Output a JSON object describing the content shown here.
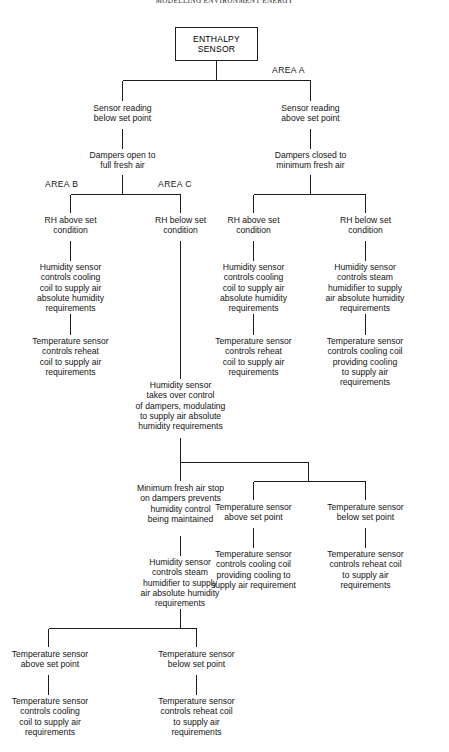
{
  "page": {
    "running_header": "MODELLING ENVIRONMENT ENERGY",
    "width": 449,
    "height": 752,
    "background": "#ffffff",
    "line_color": "#1a1a1a",
    "text_color": "#141414"
  },
  "diagram": {
    "type": "flowchart",
    "root": {
      "id": "enthalpy-sensor",
      "label": "ENTHALPY\nSENSOR",
      "shape": "box"
    },
    "area_labels": [
      {
        "id": "area-a",
        "text": "AREA A"
      },
      {
        "id": "area-b",
        "text": "AREA B"
      },
      {
        "id": "area-c",
        "text": "AREA C"
      }
    ],
    "nodes": {
      "n_sensor_below": "Sensor reading\nbelow set point",
      "n_sensor_above": "Sensor reading\nabove set point",
      "n_dampers_open": "Dampers open to\nfull fresh air",
      "n_dampers_closed": "Dampers closed to\nminimum fresh air",
      "n_rh_above_b": "RH above set\ncondition",
      "n_rh_below_c": "RH below set\ncondition",
      "n_rh_above_r": "RH above set\ncondition",
      "n_rh_below_r": "RH below set\ncondition",
      "n_hum_cool_b": "Humidity sensor\ncontrols cooling\ncoil to supply air\nabsolute humidity\nrequirements",
      "n_temp_reheat_b": "Temperature sensor\ncontrols reheat\ncoil to supply air\nrequirements",
      "n_hum_cool_r": "Humidity sensor\ncontrols cooling\ncoil to supply air\nabsolute humidity\nrequirements",
      "n_temp_reheat_r": "Temperature sensor\ncontrols reheat\ncoil to supply air\nrequirements",
      "n_hum_steam_r": "Humidity sensor\ncontrols steam\nhumidifier to supply\nair absolute humidity\nrequirements",
      "n_temp_cool_r": "Temperature sensor\ncontrols cooling coil\nproviding cooling\nto supply air\nrequirements",
      "n_hum_takeover": "Humidity sensor\ntakes over control\nof dampers, modulating\nto supply air absolute\nhumidity requirements",
      "n_min_fresh_stop": "Minimum fresh air stop\non dampers prevents\nhumidity control\nbeing maintained",
      "n_temp_above_mid": "Temperature sensor\nabove set point",
      "n_temp_below_mid": "Temperature sensor\nbelow set point",
      "n_hum_steam_low": "Humidity sensor\ncontrols steam\nhumidifier to supply\nair absolute humidity\nrequirements",
      "n_temp_cool_mid": "Temperature sensor\ncontrols cooling coil\nproviding cooling to\nsupply air requirement",
      "n_temp_reheat_mid": "Temperature sensor\ncontrols reheat coil\nto supply air\nrequirements",
      "n_temp_above_bot": "Temperature sensor\nabove set point",
      "n_temp_below_bot": "Temperature sensor\nbelow set point",
      "n_temp_cool_bot": "Temperature sensor\ncontrols cooling\ncoil to supply air\nrequirements",
      "n_temp_reheat_bot": "Temperature sensor\ncontrols reheat coil\nto supply air\nrequirements"
    }
  }
}
